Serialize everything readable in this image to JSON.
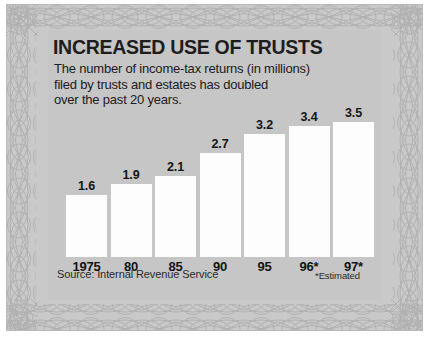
{
  "chart_data": {
    "type": "bar",
    "title": "INCREASED USE OF TRUSTS",
    "subtitle_lines": [
      "The number of income-tax returns (in millions)",
      "filed by trusts and estates has doubled",
      "over the past 20 years."
    ],
    "categories": [
      "1975",
      "80",
      "85",
      "90",
      "95",
      "96*",
      "97*"
    ],
    "values": [
      1.6,
      1.9,
      2.1,
      2.7,
      3.2,
      3.4,
      3.5
    ],
    "value_labels": [
      "1.6",
      "1.9",
      "2.1",
      "2.7",
      "3.2",
      "3.4",
      "3.5"
    ],
    "xlabel": "",
    "ylabel": "",
    "ylim": [
      0,
      3.9
    ],
    "grid": false,
    "legend": "none",
    "unit": "millions of returns",
    "source": "Source: Internal Revenue Service",
    "footnote": "*Estimated",
    "colors": {
      "bar_fill": "#fdfdfd",
      "panel_bg": "#c6c6c6",
      "plate_bg": "#c9c9c9",
      "text": "#1d1d1d",
      "border_art": "#b4b4b4"
    }
  }
}
